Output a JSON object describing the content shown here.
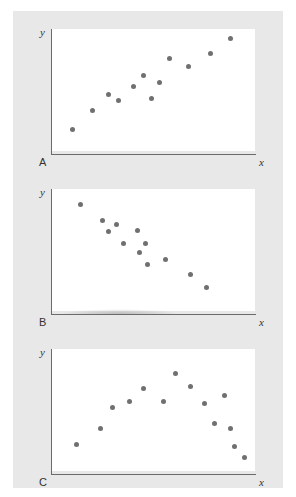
{
  "figure": {
    "background_color": "#e8e8e8",
    "plot_background_color": "#ffffff",
    "point_color": "#707070",
    "axis_color": "#6b6b6b"
  },
  "axis_labels": {
    "x": "x",
    "y": "y"
  },
  "panels": [
    {
      "letter": "A",
      "xlabel": "x",
      "ylabel": "y"
    },
    {
      "letter": "B",
      "xlabel": "x",
      "ylabel": "y"
    },
    {
      "letter": "C",
      "xlabel": "x",
      "ylabel": "y"
    }
  ],
  "chart_data": [
    {
      "type": "scatter",
      "title": "A",
      "xlabel": "x",
      "ylabel": "y",
      "grid": false,
      "legend": "none",
      "xlim": [
        0,
        100
      ],
      "ylim": [
        0,
        100
      ],
      "axis_ticks": "none",
      "relationship": "positive linear correlation",
      "points": [
        [
          10,
          18
        ],
        [
          20,
          33
        ],
        [
          28,
          46
        ],
        [
          33,
          41
        ],
        [
          40,
          53
        ],
        [
          45,
          62
        ],
        [
          49,
          43
        ],
        [
          53,
          56
        ],
        [
          58,
          76
        ],
        [
          67,
          69
        ],
        [
          78,
          80
        ],
        [
          88,
          92
        ]
      ]
    },
    {
      "type": "scatter",
      "title": "B",
      "xlabel": "x",
      "ylabel": "y",
      "grid": false,
      "legend": "none",
      "xlim": [
        0,
        100
      ],
      "ylim": [
        0,
        100
      ],
      "axis_ticks": "none",
      "relationship": "negative linear correlation",
      "points": [
        [
          14,
          87
        ],
        [
          25,
          74
        ],
        [
          28,
          65
        ],
        [
          32,
          71
        ],
        [
          35,
          55
        ],
        [
          42,
          66
        ],
        [
          43,
          48
        ],
        [
          46,
          55
        ],
        [
          47,
          38
        ],
        [
          56,
          42
        ],
        [
          68,
          30
        ],
        [
          76,
          19
        ]
      ]
    },
    {
      "type": "scatter",
      "title": "C",
      "xlabel": "x",
      "ylabel": "y",
      "grid": false,
      "legend": "none",
      "xlim": [
        0,
        100
      ],
      "ylim": [
        0,
        100
      ],
      "axis_ticks": "none",
      "relationship": "curvilinear (inverted-U) relationship",
      "points": [
        [
          12,
          22
        ],
        [
          24,
          35
        ],
        [
          30,
          52
        ],
        [
          38,
          57
        ],
        [
          45,
          68
        ],
        [
          55,
          57
        ],
        [
          61,
          80
        ],
        [
          68,
          69
        ],
        [
          75,
          55
        ],
        [
          80,
          39
        ],
        [
          85,
          62
        ],
        [
          88,
          35
        ],
        [
          90,
          20
        ],
        [
          95,
          11
        ]
      ]
    }
  ]
}
